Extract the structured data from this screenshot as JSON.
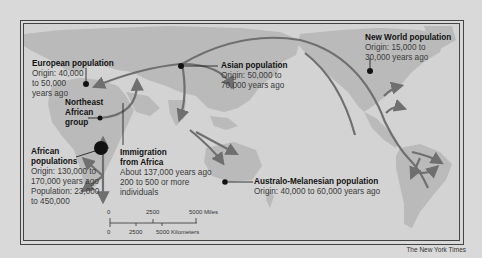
{
  "map": {
    "title": "Human migration out of Africa",
    "labels": {
      "european": {
        "title": "European population",
        "lines": [
          "Origin: 40,000",
          "to 50,000",
          "years ago"
        ]
      },
      "asian": {
        "title": "Asian population",
        "lines": [
          "Origin: 50,000 to",
          "70,000 years ago"
        ]
      },
      "new_world": {
        "title": "New World population",
        "lines": [
          "Origin: 15,000 to",
          "30,000 years ago"
        ]
      },
      "northeast_african": {
        "title_lines": [
          "Northeast",
          "African",
          "group"
        ]
      },
      "african": {
        "title_lines": [
          "African",
          "populations"
        ],
        "lines": [
          "Origin: 130,000 to",
          "170,000 years ago",
          "Population: 23,000",
          "to 450,000"
        ]
      },
      "immigration": {
        "title_lines": [
          "Immigration",
          "from Africa"
        ],
        "lines": [
          "About 137,000 years ago",
          "200 to 500 or more",
          "individuals"
        ]
      },
      "australo": {
        "title": "Australo-Melanesian population",
        "lines": [
          "Origin: 40,000 to 60,000 years ago"
        ]
      }
    },
    "scale": {
      "miles": [
        "0",
        "2500",
        "5000 Miles"
      ],
      "km": [
        "0",
        "2500",
        "5000 Kilometers"
      ]
    },
    "credit": "The New York Times",
    "colors": {
      "background": "#d9d9d9",
      "ocean": "#d3d3d3",
      "land": "#b9b9b9",
      "arrow": "#6f6f6f",
      "frame": "#444444"
    }
  }
}
